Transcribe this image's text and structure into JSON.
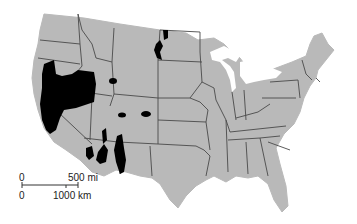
{
  "map": {
    "subject": "Contiguous United States with shaded regions",
    "colors": {
      "land": "#b9b9b9",
      "borders": "#4a4a4a",
      "highlight": "#000000",
      "water": "#ffffff"
    }
  },
  "scale_bar": {
    "top_left": "0",
    "top_right": "500 mi",
    "bottom_left": "0",
    "bottom_right": "1000 km"
  }
}
